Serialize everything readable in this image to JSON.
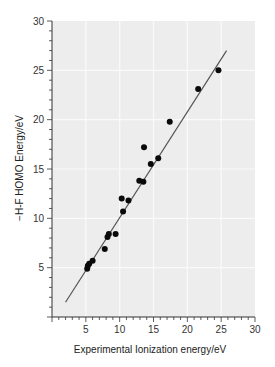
{
  "chart_data": {
    "type": "scatter",
    "title": "",
    "xlabel": "Experimental Ionization energy/eV",
    "ylabel": "−H-F HOMO Energy/eV",
    "xlim": [
      0,
      30
    ],
    "ylim": [
      0,
      30
    ],
    "xticks": [
      5,
      10,
      15,
      20,
      25,
      30
    ],
    "yticks": [
      5,
      10,
      15,
      20,
      25,
      30
    ],
    "grid": true,
    "legend": null,
    "series": [
      {
        "name": "data",
        "type": "scatter",
        "points": [
          {
            "x": 5.2,
            "y": 4.9
          },
          {
            "x": 5.3,
            "y": 5.2
          },
          {
            "x": 5.5,
            "y": 5.4
          },
          {
            "x": 6.0,
            "y": 5.7
          },
          {
            "x": 7.8,
            "y": 6.9
          },
          {
            "x": 8.2,
            "y": 8.1
          },
          {
            "x": 8.4,
            "y": 8.4
          },
          {
            "x": 9.4,
            "y": 8.4
          },
          {
            "x": 10.3,
            "y": 12.0
          },
          {
            "x": 10.5,
            "y": 10.7
          },
          {
            "x": 11.3,
            "y": 11.8
          },
          {
            "x": 12.9,
            "y": 13.8
          },
          {
            "x": 13.5,
            "y": 13.7
          },
          {
            "x": 13.6,
            "y": 17.2
          },
          {
            "x": 14.6,
            "y": 15.5
          },
          {
            "x": 15.7,
            "y": 16.1
          },
          {
            "x": 17.4,
            "y": 19.8
          },
          {
            "x": 21.6,
            "y": 23.1
          },
          {
            "x": 24.6,
            "y": 25.0
          }
        ]
      },
      {
        "name": "fit line",
        "type": "line",
        "points": [
          {
            "x": 2.0,
            "y": 1.5
          },
          {
            "x": 25.8,
            "y": 27.0
          }
        ]
      }
    ]
  },
  "axes": {
    "x_title": "Experimental Ionization energy/eV",
    "y_title": "−H-F HOMO Energy/eV",
    "x_tick_labels": [
      "5",
      "10",
      "15",
      "20",
      "25",
      "30"
    ],
    "y_tick_labels": [
      "5",
      "10",
      "15",
      "20",
      "25",
      "30"
    ]
  },
  "colors": {
    "plot_background": "#ededed",
    "grid": "#fafafa",
    "points": "#0a0a0a",
    "fit_line": "#555555",
    "axis": "#333333"
  }
}
